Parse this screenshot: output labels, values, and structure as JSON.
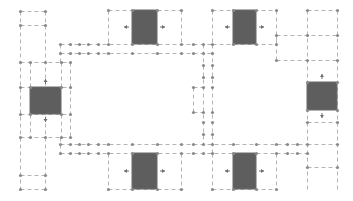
{
  "diagram": {
    "title": "",
    "width": 353,
    "height": 201,
    "colors": {
      "background": "#ffffff",
      "line": "#b4b4b4",
      "node": "#8a8a8a",
      "block": "#5e5e5e",
      "block_edge": "#6a6a6a",
      "arrow": "#6e6e6e"
    },
    "blocks": [
      {
        "id": "block-left",
        "x": 30,
        "y": 87,
        "w": 31,
        "h": 27,
        "arrows": [
          "up",
          "down"
        ]
      },
      {
        "id": "block-top-1",
        "x": 132,
        "y": 10,
        "w": 25,
        "h": 34,
        "arrows": [
          "left",
          "right"
        ]
      },
      {
        "id": "block-top-2",
        "x": 233,
        "y": 10,
        "w": 23,
        "h": 34,
        "arrows": [
          "left",
          "right"
        ]
      },
      {
        "id": "block-right",
        "x": 307,
        "y": 82,
        "w": 30,
        "h": 28,
        "arrows": [
          "up",
          "down"
        ]
      },
      {
        "id": "block-bottom-1",
        "x": 132,
        "y": 153,
        "w": 25,
        "h": 36,
        "arrows": [
          "left",
          "right"
        ]
      },
      {
        "id": "block-bottom-2",
        "x": 233,
        "y": 153,
        "w": 23,
        "h": 36,
        "arrows": [
          "left",
          "right"
        ]
      }
    ],
    "lines": [
      [
        20,
        11,
        45,
        11
      ],
      [
        20,
        25,
        45,
        25
      ],
      [
        20,
        11,
        20,
        189
      ],
      [
        45,
        11,
        45,
        189
      ],
      [
        20,
        62,
        70,
        62
      ],
      [
        30,
        62,
        30,
        87
      ],
      [
        61,
        62,
        61,
        87
      ],
      [
        70,
        62,
        70,
        137
      ],
      [
        20,
        87,
        70,
        87
      ],
      [
        20,
        114,
        70,
        114
      ],
      [
        20,
        137,
        70,
        137
      ],
      [
        30,
        114,
        30,
        137
      ],
      [
        61,
        114,
        61,
        137
      ],
      [
        20,
        175,
        45,
        175
      ],
      [
        20,
        189,
        45,
        189
      ],
      [
        60,
        44,
        212,
        44
      ],
      [
        60,
        53,
        212,
        53
      ],
      [
        60,
        44,
        60,
        62
      ],
      [
        108,
        10,
        181,
        10
      ],
      [
        108,
        10,
        108,
        44
      ],
      [
        181,
        10,
        181,
        44
      ],
      [
        212,
        10,
        276,
        10
      ],
      [
        212,
        10,
        212,
        44
      ],
      [
        276,
        10,
        276,
        44
      ],
      [
        212,
        44,
        276,
        44
      ],
      [
        276,
        35,
        337,
        35
      ],
      [
        276,
        60,
        337,
        60
      ],
      [
        276,
        35,
        276,
        60
      ],
      [
        307,
        10,
        337,
        10
      ],
      [
        307,
        10,
        307,
        189
      ],
      [
        337,
        10,
        337,
        189
      ],
      [
        203,
        44,
        203,
        144
      ],
      [
        212,
        44,
        212,
        153
      ],
      [
        193,
        87,
        203,
        87
      ],
      [
        193,
        87,
        193,
        112
      ],
      [
        193,
        112,
        203,
        112
      ],
      [
        60,
        144,
        307,
        144
      ],
      [
        60,
        153,
        276,
        153
      ],
      [
        60,
        137,
        60,
        153
      ],
      [
        108,
        153,
        108,
        189
      ],
      [
        181,
        153,
        181,
        189
      ],
      [
        108,
        189,
        181,
        189
      ],
      [
        212,
        153,
        212,
        189
      ],
      [
        276,
        153,
        276,
        189
      ],
      [
        212,
        189,
        276,
        189
      ],
      [
        276,
        153,
        307,
        153
      ],
      [
        307,
        122,
        337,
        122
      ],
      [
        307,
        167,
        337,
        167
      ],
      [
        307,
        144,
        337,
        144
      ]
    ],
    "nodes": [
      [
        20,
        11
      ],
      [
        45,
        11
      ],
      [
        20,
        25
      ],
      [
        45,
        25
      ],
      [
        20,
        62
      ],
      [
        30,
        62
      ],
      [
        45,
        62
      ],
      [
        61,
        62
      ],
      [
        70,
        62
      ],
      [
        20,
        87
      ],
      [
        30,
        87
      ],
      [
        61,
        87
      ],
      [
        70,
        87
      ],
      [
        20,
        114
      ],
      [
        30,
        114
      ],
      [
        61,
        114
      ],
      [
        70,
        114
      ],
      [
        20,
        137
      ],
      [
        30,
        137
      ],
      [
        45,
        137
      ],
      [
        61,
        137
      ],
      [
        70,
        137
      ],
      [
        20,
        175
      ],
      [
        45,
        175
      ],
      [
        20,
        189
      ],
      [
        45,
        189
      ],
      [
        60,
        44
      ],
      [
        70,
        44
      ],
      [
        79,
        44
      ],
      [
        88,
        44
      ],
      [
        98,
        44
      ],
      [
        108,
        44
      ],
      [
        132,
        44
      ],
      [
        157,
        44
      ],
      [
        181,
        44
      ],
      [
        193,
        44
      ],
      [
        203,
        44
      ],
      [
        212,
        44
      ],
      [
        60,
        53
      ],
      [
        70,
        53
      ],
      [
        79,
        53
      ],
      [
        88,
        53
      ],
      [
        98,
        53
      ],
      [
        108,
        53
      ],
      [
        132,
        53
      ],
      [
        157,
        53
      ],
      [
        181,
        53
      ],
      [
        193,
        53
      ],
      [
        203,
        53
      ],
      [
        212,
        53
      ],
      [
        108,
        10
      ],
      [
        132,
        10
      ],
      [
        157,
        10
      ],
      [
        181,
        10
      ],
      [
        212,
        10
      ],
      [
        233,
        10
      ],
      [
        256,
        10
      ],
      [
        276,
        10
      ],
      [
        233,
        44
      ],
      [
        256,
        44
      ],
      [
        276,
        44
      ],
      [
        276,
        35
      ],
      [
        307,
        35
      ],
      [
        337,
        35
      ],
      [
        276,
        60
      ],
      [
        307,
        60
      ],
      [
        337,
        60
      ],
      [
        307,
        10
      ],
      [
        337,
        10
      ],
      [
        203,
        65
      ],
      [
        212,
        65
      ],
      [
        203,
        77
      ],
      [
        212,
        77
      ],
      [
        193,
        87
      ],
      [
        203,
        87
      ],
      [
        212,
        87
      ],
      [
        193,
        112
      ],
      [
        203,
        112
      ],
      [
        212,
        112
      ],
      [
        203,
        122
      ],
      [
        212,
        122
      ],
      [
        203,
        134
      ],
      [
        212,
        134
      ],
      [
        60,
        144
      ],
      [
        70,
        144
      ],
      [
        79,
        144
      ],
      [
        88,
        144
      ],
      [
        98,
        144
      ],
      [
        108,
        144
      ],
      [
        132,
        144
      ],
      [
        157,
        144
      ],
      [
        181,
        144
      ],
      [
        193,
        144
      ],
      [
        203,
        144
      ],
      [
        212,
        144
      ],
      [
        233,
        144
      ],
      [
        256,
        144
      ],
      [
        276,
        144
      ],
      [
        287,
        144
      ],
      [
        297,
        144
      ],
      [
        307,
        144
      ],
      [
        337,
        144
      ],
      [
        60,
        153
      ],
      [
        70,
        153
      ],
      [
        79,
        153
      ],
      [
        88,
        153
      ],
      [
        98,
        153
      ],
      [
        108,
        153
      ],
      [
        132,
        153
      ],
      [
        157,
        153
      ],
      [
        181,
        153
      ],
      [
        193,
        153
      ],
      [
        203,
        153
      ],
      [
        212,
        153
      ],
      [
        233,
        153
      ],
      [
        256,
        153
      ],
      [
        276,
        153
      ],
      [
        287,
        153
      ],
      [
        297,
        153
      ],
      [
        307,
        153
      ],
      [
        108,
        189
      ],
      [
        132,
        189
      ],
      [
        157,
        189
      ],
      [
        181,
        189
      ],
      [
        212,
        189
      ],
      [
        233,
        189
      ],
      [
        256,
        189
      ],
      [
        276,
        189
      ],
      [
        307,
        82
      ],
      [
        337,
        82
      ],
      [
        307,
        110
      ],
      [
        337,
        110
      ],
      [
        307,
        122
      ],
      [
        337,
        122
      ],
      [
        307,
        167
      ],
      [
        337,
        167
      ]
    ]
  }
}
